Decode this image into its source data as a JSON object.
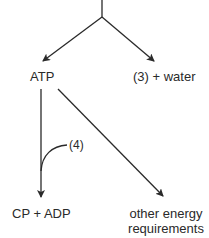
{
  "diagram": {
    "nodes": {
      "atp": "ATP",
      "product3_water": "(3) + water",
      "cp_adp": "CP + ADP",
      "other_energy_line1": "other energy",
      "other_energy_line2": "requirements"
    },
    "annotations": {
      "step4": "(4)"
    },
    "edges": [
      {
        "from": "top-input",
        "to": "ATP"
      },
      {
        "from": "top-input",
        "to": "(3) + water"
      },
      {
        "from": "ATP",
        "to": "CP + ADP",
        "annotation": "(4)"
      },
      {
        "from": "ATP",
        "to": "other energy requirements"
      }
    ],
    "colors": {
      "line": "#2a2a2a",
      "text": "#2a2a2a",
      "background": "#ffffff"
    }
  }
}
